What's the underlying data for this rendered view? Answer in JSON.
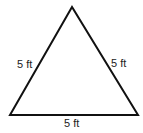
{
  "diagram": {
    "shape": "equilateral triangle",
    "stroke_color": "#111111",
    "fill_color": "#ffffff",
    "vertices": {
      "apex": [
        72,
        7
      ],
      "bottom_left": [
        10,
        115
      ],
      "bottom_right": [
        138,
        115
      ]
    },
    "sides": {
      "left": {
        "label": "5 ft"
      },
      "right": {
        "label": "5 ft"
      },
      "bottom": {
        "label": "5 ft"
      }
    }
  }
}
